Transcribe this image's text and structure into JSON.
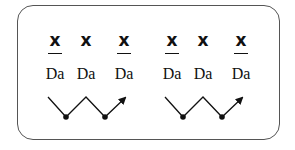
{
  "diagram": {
    "groups": [
      {
        "items": [
          {
            "symbol": "x",
            "underlined": true,
            "syllable": "Da"
          },
          {
            "symbol": "x",
            "underlined": false,
            "syllable": "Da"
          },
          {
            "symbol": "x",
            "underlined": true,
            "syllable": "Da"
          }
        ]
      },
      {
        "items": [
          {
            "symbol": "x",
            "underlined": true,
            "syllable": "Da"
          },
          {
            "symbol": "x",
            "underlined": false,
            "syllable": "Da"
          },
          {
            "symbol": "x",
            "underlined": true,
            "syllable": "Da"
          }
        ]
      }
    ],
    "contour": "zigzag-with-arrow"
  }
}
